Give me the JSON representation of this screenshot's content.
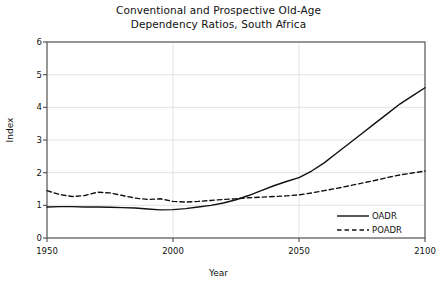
{
  "chart_data": {
    "type": "line",
    "title_line1": "Conventional and Prospective Old-Age",
    "title_line2": "Dependency Ratios, South Africa",
    "xlabel": "Year",
    "ylabel": "Index",
    "xlim": [
      1950,
      2100
    ],
    "ylim": [
      0,
      6
    ],
    "xticks": [
      1950,
      2000,
      2050,
      2100
    ],
    "xtick_labels": [
      "1950",
      "2000",
      "2050",
      "2100"
    ],
    "yticks": [
      0,
      1,
      2,
      3,
      4,
      5,
      6
    ],
    "ytick_labels": [
      "0",
      "1",
      "2",
      "3",
      "4",
      "5",
      "6"
    ],
    "grid": true,
    "grid_color": "#e3e3e3",
    "axis_color": "#4d4d4d",
    "line_color": "#111111",
    "legend_position": "bottom-right",
    "x": [
      1950,
      1955,
      1960,
      1965,
      1970,
      1975,
      1980,
      1985,
      1990,
      1995,
      2000,
      2005,
      2010,
      2015,
      2020,
      2025,
      2030,
      2035,
      2040,
      2045,
      2050,
      2055,
      2060,
      2065,
      2070,
      2075,
      2080,
      2085,
      2090,
      2095,
      2100
    ],
    "series": [
      {
        "name": "OADR",
        "style": "solid",
        "values": [
          0.95,
          0.96,
          0.96,
          0.95,
          0.95,
          0.94,
          0.93,
          0.92,
          0.89,
          0.86,
          0.87,
          0.9,
          0.95,
          1.0,
          1.07,
          1.17,
          1.3,
          1.45,
          1.6,
          1.73,
          1.85,
          2.05,
          2.3,
          2.6,
          2.9,
          3.2,
          3.5,
          3.8,
          4.1,
          4.35,
          4.6
        ]
      },
      {
        "name": "POADR",
        "style": "dashed",
        "values": [
          1.45,
          1.33,
          1.27,
          1.3,
          1.4,
          1.38,
          1.3,
          1.22,
          1.18,
          1.2,
          1.12,
          1.1,
          1.12,
          1.15,
          1.18,
          1.2,
          1.23,
          1.25,
          1.27,
          1.29,
          1.32,
          1.38,
          1.45,
          1.52,
          1.6,
          1.68,
          1.76,
          1.85,
          1.93,
          1.99,
          2.05
        ]
      }
    ],
    "legend": [
      {
        "label": "OADR",
        "style": "solid"
      },
      {
        "label": "POADR",
        "style": "dashed"
      }
    ]
  }
}
